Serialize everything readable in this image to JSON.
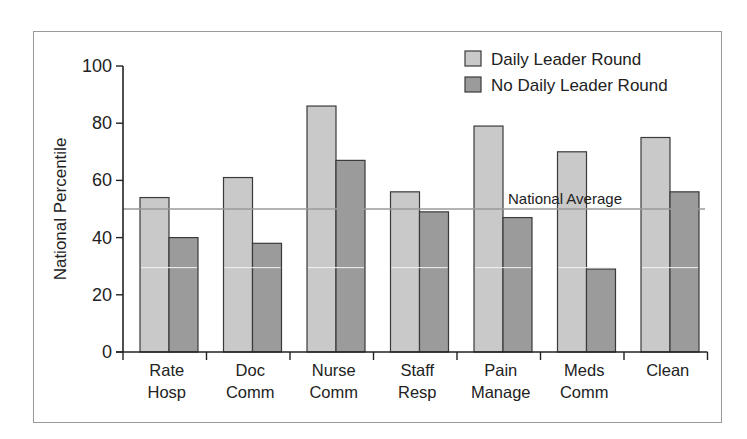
{
  "chart_data": {
    "type": "bar",
    "title": "",
    "xlabel": "",
    "ylabel": "National Percentile",
    "ylim": [
      0,
      100
    ],
    "yticks": [
      0,
      20,
      40,
      60,
      80,
      100
    ],
    "categories": [
      [
        "Rate",
        "Hosp"
      ],
      [
        "Doc",
        "Comm"
      ],
      [
        "Nurse",
        "Comm"
      ],
      [
        "Staff",
        "Resp"
      ],
      [
        "Pain",
        "Manage"
      ],
      [
        "Meds",
        "Comm"
      ],
      [
        "Clean"
      ]
    ],
    "category_names": [
      "Rate Hosp",
      "Doc Comm",
      "Nurse Comm",
      "Staff Resp",
      "Pain Manage",
      "Meds Comm",
      "Clean"
    ],
    "series": [
      {
        "name": "Daily Leader Round",
        "color": "#c9c9c9",
        "values": [
          54,
          61,
          86,
          56,
          79,
          70,
          75
        ]
      },
      {
        "name": "No Daily Leader Round",
        "color": "#9b9b9b",
        "values": [
          40,
          38,
          67,
          49,
          47,
          29,
          56
        ]
      }
    ],
    "reference_line": {
      "label": "National Average",
      "value": 50,
      "color": "#9a9a9a"
    },
    "legend_position": "top-right",
    "grid": false
  }
}
